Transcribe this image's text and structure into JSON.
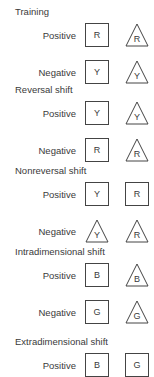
{
  "sections": [
    {
      "title": "Training",
      "rows": [
        {
          "label": "Positive",
          "stim": [
            {
              "shape": "square",
              "letter": "R"
            },
            {
              "shape": "triangle",
              "letter": "R"
            }
          ]
        },
        {
          "label": "Negative",
          "stim": [
            {
              "shape": "square",
              "letter": "Y"
            },
            {
              "shape": "triangle",
              "letter": "Y"
            }
          ]
        }
      ]
    },
    {
      "title": "Reversal shift",
      "rows": [
        {
          "label": "Positive",
          "stim": [
            {
              "shape": "square",
              "letter": "Y"
            },
            {
              "shape": "triangle",
              "letter": "Y"
            }
          ]
        },
        {
          "label": "Negative",
          "stim": [
            {
              "shape": "square",
              "letter": "R"
            },
            {
              "shape": "triangle",
              "letter": "R"
            }
          ]
        }
      ]
    },
    {
      "title": "Nonreversal shift",
      "rows": [
        {
          "label": "Positive",
          "stim": [
            {
              "shape": "square",
              "letter": "Y"
            },
            {
              "shape": "square",
              "letter": "R"
            }
          ]
        },
        {
          "label": "Negative",
          "stim": [
            {
              "shape": "triangle",
              "letter": "Y"
            },
            {
              "shape": "triangle",
              "letter": "R"
            }
          ]
        }
      ]
    },
    {
      "title": "Intradimensional shift",
      "rows": [
        {
          "label": "Positive",
          "stim": [
            {
              "shape": "square",
              "letter": "B"
            },
            {
              "shape": "triangle",
              "letter": "B"
            }
          ]
        },
        {
          "label": "Negative",
          "stim": [
            {
              "shape": "square",
              "letter": "G"
            },
            {
              "shape": "triangle",
              "letter": "G"
            }
          ]
        }
      ]
    },
    {
      "title": "Extradimensional shift",
      "rows": [
        {
          "label": "Positive",
          "stim": [
            {
              "shape": "square",
              "letter": "B"
            },
            {
              "shape": "square",
              "letter": "G"
            }
          ]
        }
      ]
    }
  ]
}
